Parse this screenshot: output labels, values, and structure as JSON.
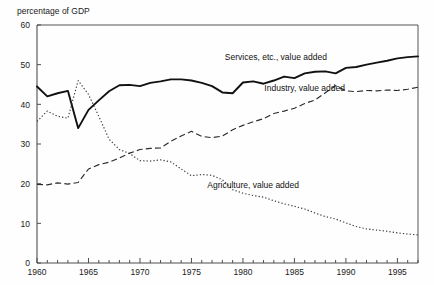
{
  "chart_data": {
    "type": "line",
    "title": "",
    "ylabel": "percentage of GDP",
    "xlabel": "",
    "ylim": [
      0,
      60
    ],
    "yticks": [
      0,
      10,
      20,
      30,
      40,
      50,
      60
    ],
    "ytick_labels": [
      "0",
      "10",
      "20",
      "30",
      "40",
      "50",
      "60"
    ],
    "xlim": [
      1960,
      1997
    ],
    "xticks": [
      1960,
      1965,
      1970,
      1975,
      1980,
      1985,
      1990,
      1995
    ],
    "xtick_labels": [
      "1960",
      "1965",
      "1970",
      "1975",
      "1980",
      "1985",
      "1990",
      "1995"
    ],
    "minor_xticks_every": 1,
    "grid": false,
    "legend_position": "inline-annotations",
    "x": [
      1960,
      1961,
      1962,
      1963,
      1964,
      1965,
      1966,
      1967,
      1968,
      1969,
      1970,
      1971,
      1972,
      1973,
      1974,
      1975,
      1976,
      1977,
      1978,
      1979,
      1980,
      1981,
      1982,
      1983,
      1984,
      1985,
      1986,
      1987,
      1988,
      1989,
      1990,
      1991,
      1992,
      1993,
      1994,
      1995,
      1996,
      1997
    ],
    "series": [
      {
        "name": "Services, etc., value added",
        "style": "solid",
        "label_x": 1983.2,
        "label_y": 51.2,
        "values": [
          44.5,
          42.0,
          42.8,
          43.4,
          34.0,
          38.6,
          41.0,
          43.3,
          44.8,
          44.9,
          44.6,
          45.4,
          45.8,
          46.3,
          46.3,
          46.0,
          45.4,
          44.6,
          43.0,
          42.8,
          45.5,
          45.8,
          45.2,
          46.0,
          47.0,
          46.6,
          47.8,
          48.2,
          48.3,
          47.8,
          49.2,
          49.4,
          50.0,
          50.5,
          51.0,
          51.6,
          51.9,
          52.1
        ]
      },
      {
        "name": "Industry, value added",
        "style": "dashed",
        "label_x": 1986.0,
        "label_y": 43.5,
        "values": [
          19.8,
          19.7,
          20.2,
          19.9,
          20.3,
          23.7,
          24.8,
          25.4,
          26.5,
          27.7,
          28.6,
          28.9,
          29.0,
          30.7,
          32.0,
          33.2,
          31.9,
          31.6,
          32.0,
          33.6,
          34.7,
          35.6,
          36.4,
          37.7,
          38.3,
          39.0,
          40.2,
          41.1,
          42.9,
          44.7,
          43.4,
          43.2,
          43.5,
          43.4,
          43.6,
          43.5,
          43.8,
          44.3
        ]
      },
      {
        "name": "Agriculture, value added",
        "style": "dotted",
        "label_x": 1981.0,
        "label_y": 19.0,
        "values": [
          35.7,
          38.3,
          37.0,
          36.5,
          46.0,
          42.5,
          37.0,
          31.2,
          28.6,
          27.6,
          25.8,
          25.7,
          26.0,
          25.5,
          23.7,
          22.0,
          22.3,
          22.1,
          21.0,
          18.5,
          17.6,
          17.0,
          16.6,
          15.7,
          14.9,
          14.3,
          13.6,
          12.6,
          11.7,
          11.1,
          10.1,
          9.2,
          8.6,
          8.3,
          8.0,
          7.6,
          7.3,
          7.1
        ]
      }
    ]
  },
  "colors": {
    "background": "#fefefe",
    "axis": "#4d4d4d",
    "solid_series": "#111111",
    "dashed_series": "#2b2b2b",
    "dotted_series": "#3a3a3a"
  }
}
